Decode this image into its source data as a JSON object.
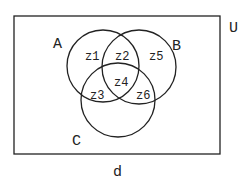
{
  "diagram": {
    "type": "venn",
    "universe_label": "U",
    "caption": "d",
    "sets": [
      {
        "name": "A",
        "label": "A"
      },
      {
        "name": "B",
        "label": "B"
      },
      {
        "name": "C",
        "label": "C"
      }
    ],
    "regions": {
      "z1": "z1",
      "z2": "z2",
      "z3": "z3",
      "z4": "z4",
      "z5": "z5",
      "z6": "z6"
    },
    "line_color": "#222222"
  }
}
